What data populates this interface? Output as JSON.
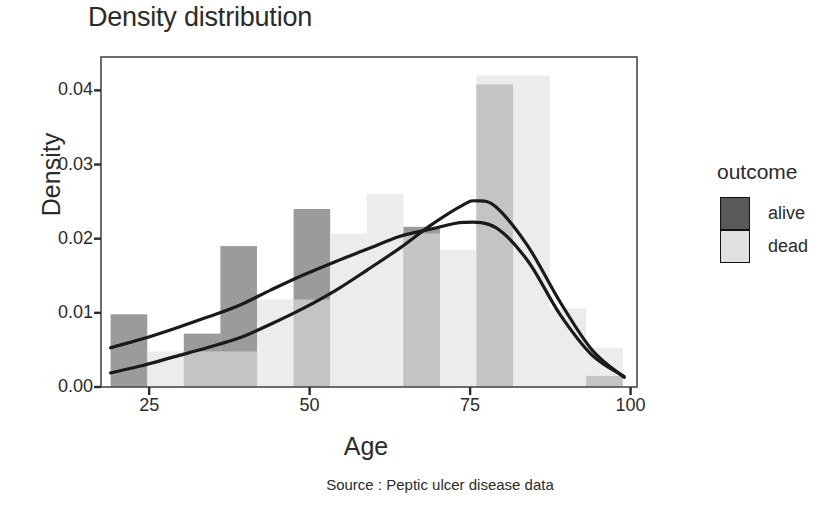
{
  "title": "Density distribution",
  "caption": "Source : Peptic ulcer disease data",
  "legend": {
    "title": "outcome",
    "items": [
      {
        "label": "alive",
        "color": "#595959"
      },
      {
        "label": "dead",
        "color": "#e0e0e0"
      }
    ]
  },
  "chart_data": {
    "type": "area",
    "title": "Density distribution",
    "subtitle": "Source : Peptic ulcer disease data",
    "xlabel": "Age",
    "ylabel": "Density",
    "xlim": [
      17.5,
      101.0
    ],
    "ylim": [
      0.0,
      0.0445
    ],
    "xticks": [
      25,
      50,
      75,
      100
    ],
    "xticklabels": [
      "25",
      "50",
      "75",
      "100"
    ],
    "yticks": [
      0.0,
      0.01,
      0.02,
      0.03,
      0.04
    ],
    "yticklabels": [
      "0.00",
      "0.01",
      "0.02",
      "0.03",
      "0.04"
    ],
    "grid": false,
    "legend_position": "right",
    "legend_title": "outcome",
    "overlap_alpha": 0.6,
    "bin_edges": [
      19.0,
      24.7,
      30.4,
      36.1,
      41.8,
      47.5,
      53.2,
      58.9,
      64.6,
      70.3,
      76.0,
      81.7,
      87.4,
      93.1,
      98.8
    ],
    "series": [
      {
        "name": "alive",
        "color": "#595959",
        "histogram": [
          0.0098,
          0.0,
          0.0072,
          0.019,
          0.0,
          0.024,
          0.0,
          0.0,
          0.0216,
          0.0,
          0.0408,
          0.0,
          0.0,
          0.0015
        ],
        "density_curve": {
          "x": [
            19,
            24,
            29,
            34,
            39,
            44,
            49,
            54,
            59,
            64,
            69,
            74,
            76,
            79,
            84,
            89,
            94,
            99
          ],
          "y": [
            0.0019,
            0.0029,
            0.0041,
            0.0053,
            0.0066,
            0.0085,
            0.0106,
            0.013,
            0.0158,
            0.0187,
            0.0219,
            0.0246,
            0.0251,
            0.0243,
            0.019,
            0.0115,
            0.005,
            0.0013
          ]
        }
      },
      {
        "name": "dead",
        "color": "#e0e0e0",
        "histogram": [
          0.0,
          0.0048,
          0.0048,
          0.0048,
          0.0118,
          0.0118,
          0.0207,
          0.026,
          0.0207,
          0.0185,
          0.042,
          0.042,
          0.0106,
          0.0053
        ],
        "density_curve": {
          "x": [
            19,
            24,
            29,
            34,
            39,
            44,
            49,
            54,
            59,
            64,
            69,
            74,
            79,
            84,
            89,
            94,
            99
          ],
          "y": [
            0.0053,
            0.0065,
            0.0079,
            0.0094,
            0.011,
            0.0131,
            0.0151,
            0.0169,
            0.0186,
            0.0203,
            0.0213,
            0.0222,
            0.0215,
            0.017,
            0.0098,
            0.0043,
            0.0014
          ]
        }
      }
    ]
  },
  "axis_pixels": {
    "plot_left": 101,
    "plot_right": 637,
    "plot_top": 57,
    "plot_bottom": 387,
    "x0_value": 17.5,
    "x1_value": 101.0,
    "y0_value": 0.0,
    "y1_value": 0.0445
  }
}
